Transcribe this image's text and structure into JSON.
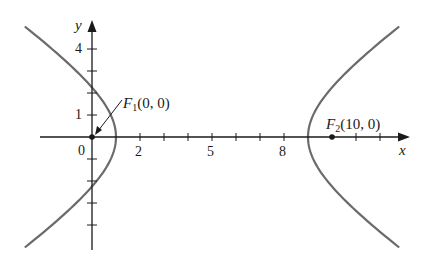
{
  "figure": {
    "type": "hyperbola-diagram",
    "colors": {
      "axis": "#1a1a1a",
      "curve": "#6b6b6b",
      "text": "#1a1a1a",
      "background": "#ffffff"
    },
    "axes": {
      "x_label": "x",
      "y_label": "y",
      "origin_label": "0",
      "x_tick_labels": [
        {
          "value": 2,
          "text": "2"
        },
        {
          "value": 5,
          "text": "5"
        },
        {
          "value": 8,
          "text": "8"
        }
      ],
      "y_tick_labels": [
        {
          "value": 1,
          "text": "1"
        },
        {
          "value": 4,
          "text": "4"
        }
      ],
      "x_ticks": [
        2,
        3,
        4,
        5,
        6,
        7,
        8,
        11,
        12
      ],
      "y_ticks": [
        -4,
        -3,
        -2,
        -1,
        1,
        2,
        3,
        4
      ]
    },
    "foci": [
      {
        "name": "F1",
        "symbol": "F",
        "subscript": "1",
        "coords": "(0, 0)",
        "x": 0,
        "y": 0
      },
      {
        "name": "F2",
        "symbol": "F",
        "subscript": "2",
        "coords": "(10, 0)",
        "x": 10,
        "y": 0
      }
    ],
    "curve": {
      "equation": "(x-5)^2/16 - y^2/9 = 1",
      "center": [
        5,
        0
      ],
      "a": 4,
      "b": 3,
      "c": 5,
      "vertices": [
        [
          1,
          0
        ],
        [
          9,
          0
        ]
      ]
    }
  }
}
